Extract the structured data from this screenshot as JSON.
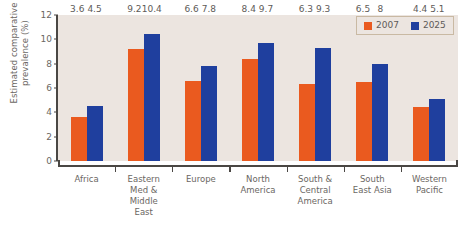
{
  "chart_data": {
    "type": "bar",
    "title": "",
    "subtitle": "",
    "xlabel": "",
    "ylabel": "Estimated comparative\nprevalence (%)",
    "ylim": [
      0,
      12
    ],
    "yticks": [
      0,
      2,
      4,
      6,
      8,
      10,
      12
    ],
    "ytick_labels": [
      "0",
      "2",
      "4",
      "6",
      "8",
      "10",
      "12"
    ],
    "grid": false,
    "legend_position": "top-right",
    "plot_background": "#ece5e0",
    "categories": [
      "Africa",
      "Eastern\nMed &\nMiddle\nEast",
      "Europe",
      "North\nAmerica",
      "South &\nCentral\nAmerica",
      "South\nEast Asia",
      "Western\nPacific"
    ],
    "series": [
      {
        "name": "2007",
        "color": "#ea5a1f",
        "values": [
          3.6,
          9.2,
          6.6,
          8.4,
          6.3,
          6.5,
          4.4
        ],
        "value_labels": [
          "3.6",
          "9.2",
          "6.6",
          "8.4",
          "6.3",
          "6.5",
          "4.4"
        ]
      },
      {
        "name": "2025",
        "color": "#1f3f9e",
        "values": [
          4.5,
          10.4,
          7.8,
          9.7,
          9.3,
          8,
          5.1
        ],
        "value_labels": [
          "4.5",
          "10.4",
          "7.8",
          "9.7",
          "9.3",
          "8",
          "5.1"
        ]
      }
    ]
  },
  "legend": {
    "items": [
      {
        "label": "2007",
        "color": "#ea5a1f"
      },
      {
        "label": "2025",
        "color": "#1f3f9e"
      }
    ]
  }
}
